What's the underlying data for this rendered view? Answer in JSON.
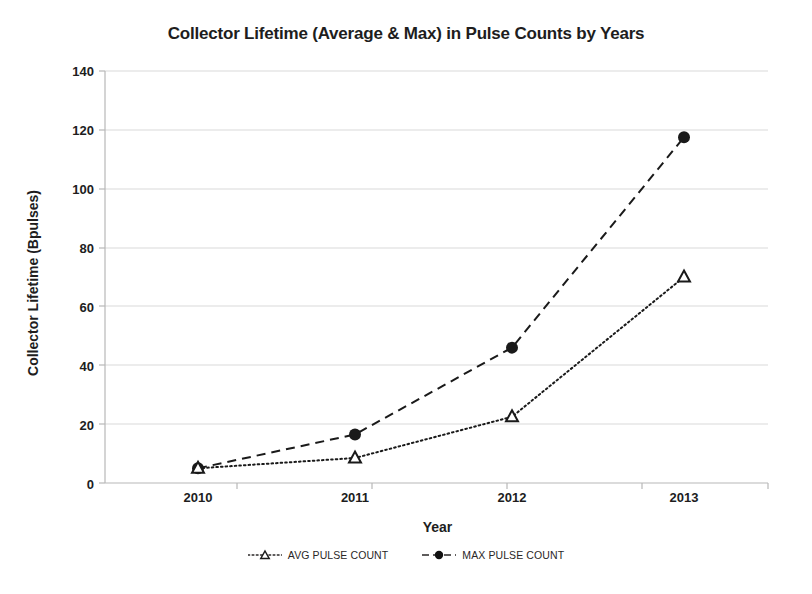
{
  "chart_data": {
    "type": "line",
    "title": "Collector Lifetime (Average & Max) in Pulse Counts by Years",
    "xlabel": "Year",
    "ylabel": "Collector Lifetime (Bpulses)",
    "categories": [
      "2010",
      "2011",
      "2012",
      "2013"
    ],
    "x": [
      2010,
      2011,
      2012,
      2013
    ],
    "ylim": [
      0,
      140
    ],
    "yticks": [
      0,
      20,
      40,
      60,
      80,
      100,
      120,
      140
    ],
    "ytick_labels": [
      "0",
      "20",
      "40",
      "60",
      "80",
      "100",
      "120",
      "140"
    ],
    "grid": "horizontal",
    "legend_position": "bottom",
    "series": [
      {
        "name": "AVG PULSE COUNT",
        "values": [
          5,
          8.5,
          22.5,
          70
        ],
        "marker": "triangle-open",
        "linestyle": "dotted",
        "color": "#1a1a1a"
      },
      {
        "name": "MAX PULSE COUNT",
        "values": [
          5,
          16.5,
          46,
          117.5
        ],
        "marker": "circle-filled",
        "linestyle": "dashed",
        "color": "#1a1a1a"
      }
    ]
  },
  "legend": {
    "items": [
      {
        "label": "AVG PULSE COUNT"
      },
      {
        "label": "MAX PULSE COUNT"
      }
    ]
  },
  "axis": {
    "y_labels": [
      "140",
      "120",
      "100",
      "80",
      "60",
      "40",
      "20",
      "0"
    ],
    "x_labels": [
      "2010",
      "2011",
      "2012",
      "2013"
    ]
  },
  "colors": {
    "series": "#1a1a1a",
    "grid": "#d9d9d9",
    "axis": "#b0b0b0",
    "text": "#201d1d",
    "background": "#ffffff"
  }
}
